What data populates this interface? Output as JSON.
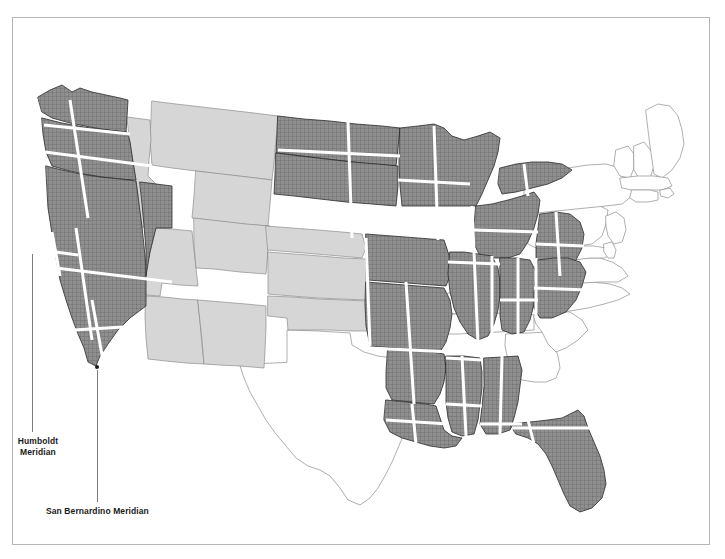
{
  "figure": {
    "type": "thematic-map",
    "frame_border_color": "#b5b5b5",
    "background_color": "#ffffff"
  },
  "annotations": [
    {
      "id": "humboldt",
      "label": "Humboldt\nMeridian",
      "label_line1": "Humboldt",
      "label_line2": "Meridian",
      "leader": {
        "x": 32,
        "y_top": 254,
        "y_bottom": 432
      },
      "anchor": {
        "x": 48,
        "y": 252
      }
    },
    {
      "id": "san-bernardino",
      "label": "San Bernardino Meridian",
      "leader": {
        "x": 97,
        "y_top": 370,
        "y_bottom": 502
      },
      "anchor": {
        "x": 97,
        "y": 367
      }
    }
  ],
  "legend_classes": {
    "surveyed_hatched": {
      "name": "PLSS surveyed / gridded states",
      "fill": "#8c8c8c",
      "pattern": "cross-hatch"
    },
    "light_gray": {
      "name": "Public-domain states without dense grid shown",
      "fill": "#d6d6d6",
      "pattern": "solid"
    },
    "white": {
      "name": "State-land / non-PLSS states",
      "fill": "#ffffff",
      "pattern": "none"
    },
    "meridian_line": {
      "name": "Principal meridian and baseline",
      "stroke": "#ffffff"
    }
  },
  "states": {
    "hatched": [
      "Washington",
      "Oregon",
      "California",
      "Nevada",
      "Idaho-partial",
      "North Dakota",
      "South Dakota",
      "Minnesota",
      "Wisconsin",
      "Michigan",
      "Iowa",
      "Illinois",
      "Indiana",
      "Ohio",
      "Missouri",
      "Arkansas",
      "Louisiana",
      "Mississippi",
      "Alabama",
      "Florida"
    ],
    "light_gray": [
      "Montana",
      "Wyoming",
      "Utah",
      "Arizona",
      "Colorado",
      "New Mexico",
      "Nebraska",
      "Kansas",
      "Oklahoma",
      "Idaho"
    ],
    "white": [
      "Texas",
      "Kentucky",
      "Tennessee",
      "Georgia",
      "South Carolina",
      "North Carolina",
      "Virginia",
      "West Virginia",
      "Maryland",
      "Delaware",
      "Pennsylvania",
      "New Jersey",
      "New York",
      "Connecticut",
      "Rhode Island",
      "Massachusetts",
      "Vermont",
      "New Hampshire",
      "Maine"
    ]
  }
}
